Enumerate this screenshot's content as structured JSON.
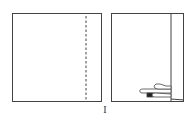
{
  "diagram": {
    "type": "folding-instruction",
    "steps": [
      {
        "panel": "left",
        "description": "Square sheet with vertical dashed fold line near right edge"
      },
      {
        "panel": "right",
        "description": "Right strip folded over, hand pressing crease at bottom"
      }
    ],
    "step_label": "I",
    "colors": {
      "line": "#444444",
      "background": "#ffffff"
    }
  }
}
